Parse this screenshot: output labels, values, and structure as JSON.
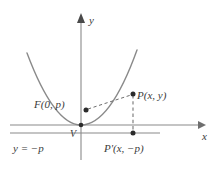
{
  "figure": {
    "kind": "parabola-focus-directrix-diagram",
    "width": 215,
    "height": 171,
    "background_color": "#ffffff",
    "stroke_color": "#8a8a8a",
    "curve_color": "#8a8a8a",
    "text_color": "#3b3b3b",
    "point_color": "#2b2b2b"
  },
  "axes": {
    "x_axis_label": "x",
    "y_axis_label": "y",
    "x_axis": {
      "y": 125,
      "x_start": 10,
      "x_end": 202,
      "arrow": "right"
    },
    "y_axis": {
      "x": 81,
      "y_start": 160,
      "y_end": 15,
      "arrow": "up"
    }
  },
  "curve": {
    "name": "parabola",
    "vertex": {
      "x": 81,
      "y": 125
    },
    "opens": "up",
    "left_end": {
      "x": 27,
      "y": 53
    },
    "right_end": {
      "x": 137,
      "y": 50
    }
  },
  "points": [
    {
      "id": "focus",
      "label": "F(0, p)",
      "dot": {
        "x": 86,
        "y": 110
      },
      "label_pos": {
        "x": 34,
        "y": 108
      }
    },
    {
      "id": "point-p",
      "label": "P(x, y)",
      "dot": {
        "x": 133,
        "y": 94
      },
      "label_pos": {
        "x": 137,
        "y": 99
      }
    },
    {
      "id": "point-p-prime",
      "label": "P'(x, −p)",
      "dot": {
        "x": 133,
        "y": 133
      },
      "label_pos": {
        "x": 104,
        "y": 150
      }
    },
    {
      "id": "vertex",
      "label": "V",
      "dot": {
        "x": 81,
        "y": 125
      },
      "label_pos": {
        "x": 70,
        "y": 136
      }
    }
  ],
  "directrix": {
    "equation_label": "y = −p",
    "y": 133,
    "x_start": 10,
    "x_end": 160,
    "label_pos": {
      "x": 13,
      "y": 150
    }
  },
  "dashed_segments": [
    {
      "id": "focus-to-point",
      "from": {
        "x": 88,
        "y": 109
      },
      "to": {
        "x": 131,
        "y": 95
      }
    },
    {
      "id": "point-to-directrix",
      "from": {
        "x": 133,
        "y": 95
      },
      "to": {
        "x": 133,
        "y": 132
      }
    }
  ]
}
